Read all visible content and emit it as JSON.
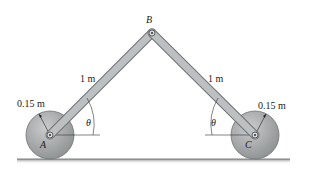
{
  "diagram": {
    "type": "mechanism",
    "labels": {
      "point_A": "A",
      "point_B": "B",
      "point_C": "C",
      "link_AB_length": "1 m",
      "link_BC_length": "1 m",
      "wheel_A_radius": "0.15 m",
      "wheel_C_radius": "0.15 m",
      "angle_A": "θ",
      "angle_C": "θ"
    },
    "colors": {
      "link_fill": "#b9bcbd",
      "link_stroke": "#6f7374",
      "wheel_fill": "#a7aaab",
      "wheel_stroke": "#6f7374",
      "ground": "#8d9091"
    }
  }
}
